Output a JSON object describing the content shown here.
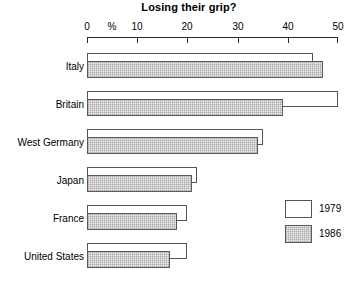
{
  "chart_data": {
    "type": "bar",
    "orientation": "horizontal",
    "title": "Losing their grip?",
    "xlabel": "%",
    "ylabel": "",
    "xlim": [
      0,
      50
    ],
    "xticks": [
      0,
      10,
      20,
      30,
      40,
      50
    ],
    "xtick_labels": [
      "0",
      "10",
      "20",
      "30",
      "40",
      "50"
    ],
    "unit_label": "%",
    "grid": false,
    "legend_position": "right-middle",
    "categories": [
      "Italy",
      "Britain",
      "West Germany",
      "Japan",
      "France",
      "United States"
    ],
    "series": [
      {
        "name": "1979",
        "color": "#ffffff",
        "values": [
          45,
          50,
          35,
          22,
          20,
          20
        ]
      },
      {
        "name": "1986",
        "color": "#ececec",
        "values": [
          47,
          39,
          34,
          21,
          18,
          16.5
        ]
      }
    ]
  },
  "legend": {
    "entries": [
      {
        "label": "1979",
        "swatch": "white-square-icon"
      },
      {
        "label": "1986",
        "swatch": "hatched-square-icon"
      }
    ]
  },
  "axis": {
    "percent_symbol": "%",
    "ticks": [
      {
        "value": 0,
        "label": "0"
      },
      {
        "value": 10,
        "label": "10"
      },
      {
        "value": 20,
        "label": "20"
      },
      {
        "value": 30,
        "label": "30"
      },
      {
        "value": 40,
        "label": "40"
      },
      {
        "value": 50,
        "label": "50"
      }
    ]
  },
  "rows": [
    {
      "label": "Italy",
      "v1979": 45,
      "v1986": 47
    },
    {
      "label": "Britain",
      "v1979": 50,
      "v1986": 39
    },
    {
      "label": "West Germany",
      "v1979": 35,
      "v1986": 34
    },
    {
      "label": "Japan",
      "v1979": 22,
      "v1986": 21
    },
    {
      "label": "France",
      "v1979": 20,
      "v1986": 18
    },
    {
      "label": "United States",
      "v1979": 20,
      "v1986": 16.5
    }
  ]
}
